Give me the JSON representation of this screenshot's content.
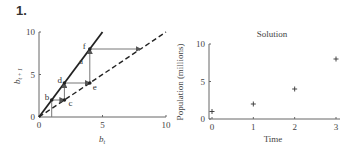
{
  "problem_number": "1.",
  "chart_data": [
    {
      "type": "line",
      "title": "",
      "xlabel": "b_t",
      "ylabel": "b_{t+1}",
      "xlim": [
        0,
        10
      ],
      "ylim": [
        0,
        10
      ],
      "xticks": [
        "0",
        "5",
        "10"
      ],
      "yticks": [
        "0",
        "5",
        "10"
      ],
      "series": [
        {
          "name": "updating function",
          "style": "solid",
          "points": [
            [
              0,
              0
            ],
            [
              5,
              10
            ]
          ]
        },
        {
          "name": "diagonal",
          "style": "dashed",
          "points": [
            [
              0,
              0
            ],
            [
              10,
              10
            ]
          ]
        },
        {
          "name": "cobweb",
          "style": "thin",
          "points": [
            [
              1,
              0
            ],
            [
              1,
              2
            ],
            [
              2,
              2
            ],
            [
              2,
              4
            ],
            [
              4,
              4
            ],
            [
              4,
              8
            ],
            [
              8,
              8
            ]
          ]
        }
      ],
      "annotations": [
        {
          "text": "a",
          "x": 3,
          "y": 6
        },
        {
          "text": "b",
          "x": 1,
          "y": 2
        },
        {
          "text": "c",
          "x": 2,
          "y": 2
        },
        {
          "text": "d",
          "x": 2,
          "y": 4
        },
        {
          "text": "e",
          "x": 4,
          "y": 4
        },
        {
          "text": "f",
          "x": 4,
          "y": 8
        }
      ]
    },
    {
      "type": "scatter",
      "title": "Solution",
      "xlabel": "Time",
      "ylabel": "Population (millions)",
      "xlim": [
        0,
        3
      ],
      "ylim": [
        0,
        10
      ],
      "xticks": [
        "0",
        "1",
        "2",
        "3"
      ],
      "yticks": [
        "0",
        "5",
        "10"
      ],
      "x": [
        0,
        1,
        2,
        3
      ],
      "y": [
        1,
        2,
        4,
        8
      ],
      "marker": "+"
    }
  ]
}
